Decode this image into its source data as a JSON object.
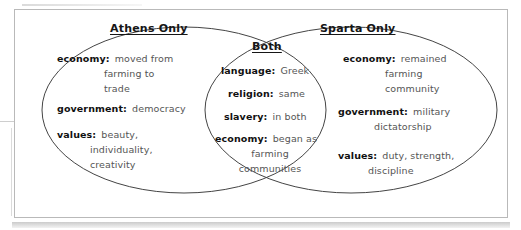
{
  "diagram": {
    "type": "venn",
    "title_left": "Athens Only",
    "title_center": "Both",
    "title_right": "Sparta Only",
    "left": {
      "heading": "Athens Only",
      "entries": [
        {
          "term": "economy:",
          "value": "moved from farming to trade",
          "lines": [
            "moved from",
            "farming to",
            "trade"
          ]
        },
        {
          "term": "government:",
          "value": "democracy",
          "lines": [
            "democracy"
          ]
        },
        {
          "term": "values:",
          "value": "beauty, individuality, creativity",
          "lines": [
            "beauty,",
            "individuality,",
            "creativity"
          ]
        }
      ]
    },
    "center": {
      "heading": "Both",
      "entries": [
        {
          "term": "language:",
          "value": "Greek",
          "lines": [
            "Greek"
          ]
        },
        {
          "term": "religion:",
          "value": "same",
          "lines": [
            "same"
          ]
        },
        {
          "term": "slavery:",
          "value": "in both",
          "lines": [
            "in both"
          ]
        },
        {
          "term": "economy:",
          "value": "began as farming communities",
          "lines": [
            "began as",
            "farming",
            "communities"
          ]
        }
      ]
    },
    "right": {
      "heading": "Sparta Only",
      "entries": [
        {
          "term": "economy:",
          "value": "remained farming community",
          "lines": [
            "remained",
            "farming",
            "community"
          ]
        },
        {
          "term": "government:",
          "value": "military dictatorship",
          "lines": [
            "military",
            "dictatorship"
          ]
        },
        {
          "term": "values:",
          "value": "duty, strength, discipline",
          "lines": [
            "duty, strength,",
            "discipline"
          ]
        }
      ]
    },
    "colors": {
      "stroke": "#444444",
      "frame": "#b9b9b9",
      "term_text": "#111111",
      "value_text": "#555555",
      "background": "#ffffff"
    }
  }
}
